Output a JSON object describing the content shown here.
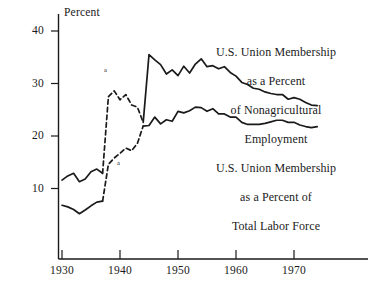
{
  "chart_data": {
    "type": "line",
    "title": "",
    "xlabel": "",
    "ylabel": "Percent",
    "xlim": [
      1928,
      1975
    ],
    "ylim": [
      0,
      42
    ],
    "xticks": [
      1930,
      1940,
      1950,
      1960,
      1970
    ],
    "yticks": [
      10,
      20,
      30,
      40
    ],
    "grid": false,
    "legend_position": "inline-annotation",
    "series": [
      {
        "name": "U.S. Union Membership as a Percent of Nonagricultural Employment",
        "annotation_label": "U.S. Union Membership\nas a Percent\nof Nonagricultural\nEmployment",
        "footnote_mark": "a",
        "x": [
          1930,
          1931,
          1932,
          1933,
          1934,
          1935,
          1936,
          1937,
          1938,
          1939,
          1940,
          1941,
          1942,
          1943,
          1944,
          1945,
          1946,
          1947,
          1948,
          1949,
          1950,
          1951,
          1952,
          1953,
          1954,
          1955,
          1956,
          1957,
          1958,
          1959,
          1960,
          1961,
          1962,
          1963,
          1964,
          1965,
          1966,
          1967,
          1968,
          1969,
          1970,
          1971,
          1972,
          1973,
          1974
        ],
        "y": [
          11.6,
          12.4,
          12.9,
          11.3,
          11.8,
          13.2,
          13.7,
          12.9,
          27.5,
          28.6,
          26.9,
          27.9,
          25.9,
          25.5,
          22.6,
          35.5,
          34.5,
          33.6,
          31.8,
          32.6,
          31.5,
          33.3,
          32.0,
          33.7,
          34.7,
          33.2,
          33.4,
          32.8,
          33.2,
          32.1,
          31.4,
          30.2,
          29.8,
          29.1,
          28.9,
          28.4,
          28.1,
          27.9,
          27.9,
          27.0,
          27.3,
          27.0,
          26.4,
          25.9,
          25.8
        ]
      },
      {
        "name": "U.S. Union Membership as a Percent of Total Labor Force",
        "annotation_label": "U.S. Union Membership\nas a Percent of\nTotal Labor Force",
        "footnote_mark": "a",
        "x": [
          1930,
          1931,
          1932,
          1933,
          1934,
          1935,
          1936,
          1937,
          1938,
          1939,
          1940,
          1941,
          1942,
          1943,
          1944,
          1945,
          1946,
          1947,
          1948,
          1949,
          1950,
          1951,
          1952,
          1953,
          1954,
          1955,
          1956,
          1957,
          1958,
          1959,
          1960,
          1961,
          1962,
          1963,
          1964,
          1965,
          1966,
          1967,
          1968,
          1969,
          1970,
          1971,
          1972,
          1973,
          1974
        ],
        "y": [
          6.8,
          6.5,
          6.0,
          5.2,
          5.9,
          6.7,
          7.4,
          7.6,
          14.6,
          15.8,
          16.7,
          17.7,
          17.2,
          18.6,
          21.9,
          22.0,
          23.6,
          22.3,
          23.1,
          22.8,
          24.7,
          24.4,
          24.8,
          25.5,
          25.4,
          24.7,
          25.2,
          24.2,
          24.2,
          23.6,
          23.6,
          22.6,
          22.2,
          22.2,
          22.2,
          22.4,
          22.7,
          23.0,
          23.0,
          22.6,
          22.6,
          22.1,
          21.8,
          21.6,
          21.8
        ]
      }
    ]
  },
  "axis": {
    "y_title": "Percent",
    "y_tick_labels": [
      "40",
      "30",
      "20",
      "10"
    ],
    "x_tick_labels": [
      "1930",
      "1940",
      "1950",
      "1960",
      "1970"
    ]
  },
  "annotations": {
    "upper_series_label_lines": [
      "U.S. Union Membership",
      "as a Percent",
      "of Nonagricultural",
      "Employment"
    ],
    "lower_series_label_lines": [
      "U.S. Union Membership",
      "as a Percent of",
      "Total Labor Force"
    ],
    "upper_footnote_mark": "a",
    "lower_footnote_mark": "a"
  },
  "colors": {
    "ink": "#1a1a1a",
    "background": "#ffffff"
  }
}
